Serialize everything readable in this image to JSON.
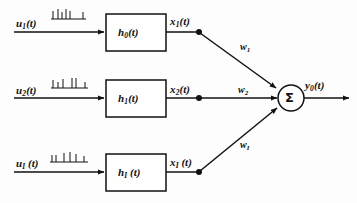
{
  "diagram": {
    "colors": {
      "stroke": "#111111",
      "background": "#ffffff",
      "node": "#111111"
    },
    "branches": [
      {
        "input_label": "u",
        "input_sub": "1",
        "input_arg": "(t)",
        "waveform_name": "spike-train",
        "block_label": "h",
        "block_sub": "0",
        "block_arg": "(t)",
        "out_label": "x",
        "out_sub": "1",
        "out_arg": "(t)",
        "weight_label": "w",
        "weight_sub": "1"
      },
      {
        "input_label": "u",
        "input_sub": "2",
        "input_arg": "(t)",
        "waveform_name": "spike-train",
        "block_label": "h",
        "block_sub": "1",
        "block_arg": "(t)",
        "out_label": "x",
        "out_sub": "2",
        "out_arg": "(t)",
        "weight_label": "w",
        "weight_sub": "2"
      },
      {
        "input_label": "u",
        "input_sub": "I",
        "input_arg": "(t)",
        "waveform_name": "spike-train",
        "block_label": "h",
        "block_sub": "I",
        "block_arg": "(t)",
        "out_label": "x",
        "out_sub": "I",
        "out_arg": "(t)",
        "weight_label": "w",
        "weight_sub": "I"
      }
    ],
    "summation": {
      "glyph": "Σ",
      "name": "summation-node"
    },
    "output": {
      "label": "y",
      "sub": "0",
      "arg": "(t)"
    }
  }
}
